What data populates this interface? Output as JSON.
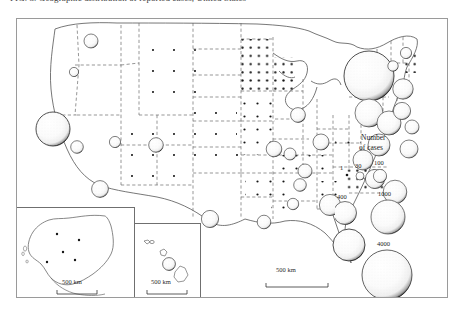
{
  "caption": {
    "text": "FIG. 3.  Geographic distribution of reported cases, United States",
    "suffix": "continued"
  },
  "map": {
    "title": "United States dot-density and proportional-symbol case map",
    "legend": {
      "title_line1": "Number",
      "title_line2": "of cases",
      "unit_dot_label": "1",
      "classes": [
        {
          "label": "30",
          "value": 30,
          "radius": 4.0
        },
        {
          "label": "100",
          "value": 100,
          "radius": 6.6
        },
        {
          "label": "400",
          "value": 400,
          "radius": 11.5
        },
        {
          "label": "1000",
          "value": 1000,
          "radius": 17.0
        },
        {
          "label": "4000",
          "value": 4000,
          "radius": 25.0
        }
      ]
    },
    "scale_bars": [
      {
        "name": "main-map-scale",
        "label": "500 km"
      },
      {
        "name": "alaska-scale",
        "label": "500 km"
      },
      {
        "name": "hawaii-scale",
        "label": "500 km"
      }
    ],
    "insets": [
      {
        "name": "alaska-inset",
        "label": "Alaska"
      },
      {
        "name": "hawaii-inset",
        "label": "Hawaii"
      }
    ]
  },
  "chart_data": {
    "type": "map",
    "symbol_encoding": "proportional-circle-area",
    "dot_encoding": "1 dot = 1 case",
    "legend_breaks": [
      1,
      30,
      100,
      400,
      1000,
      4000
    ],
    "symbols": [
      {
        "state": "WA",
        "value": 100,
        "x": 74,
        "y": 22,
        "r": 7.0
      },
      {
        "state": "OR",
        "value": 40,
        "x": 57,
        "y": 53,
        "r": 4.6
      },
      {
        "state": "CA",
        "value": 1000,
        "x": 36,
        "y": 110,
        "r": 17.0
      },
      {
        "state": "NV",
        "value": 90,
        "x": 60,
        "y": 128,
        "r": 6.3
      },
      {
        "state": "UT",
        "value": 70,
        "x": 98,
        "y": 123,
        "r": 5.6
      },
      {
        "state": "AZ",
        "value": 180,
        "x": 83,
        "y": 170,
        "r": 8.4
      },
      {
        "state": "CO",
        "value": 120,
        "x": 139,
        "y": 126,
        "r": 7.3
      },
      {
        "state": "TX",
        "value": 180,
        "x": 193,
        "y": 200,
        "r": 8.6
      },
      {
        "state": "IL",
        "value": 150,
        "x": 257,
        "y": 130,
        "r": 7.8
      },
      {
        "state": "MI",
        "value": 130,
        "x": 281,
        "y": 96,
        "r": 7.4
      },
      {
        "state": "OH",
        "value": 160,
        "x": 304,
        "y": 123,
        "r": 8.0
      },
      {
        "state": "IN",
        "value": 80,
        "x": 273,
        "y": 135,
        "r": 6.0
      },
      {
        "state": "KY",
        "value": 120,
        "x": 288,
        "y": 152,
        "r": 7.0
      },
      {
        "state": "TN",
        "value": 90,
        "x": 283,
        "y": 166,
        "r": 6.3
      },
      {
        "state": "GA",
        "value": 330,
        "x": 313,
        "y": 186,
        "r": 10.6
      },
      {
        "state": "AL",
        "value": 70,
        "x": 276,
        "y": 185,
        "r": 5.7
      },
      {
        "state": "LA",
        "value": 110,
        "x": 247,
        "y": 203,
        "r": 6.8
      },
      {
        "state": "FL",
        "value": 900,
        "x": 332,
        "y": 226,
        "r": 16.0
      },
      {
        "state": "NY",
        "value": 4000,
        "x": 352,
        "y": 57,
        "r": 25.0
      },
      {
        "state": "PA",
        "value": 700,
        "x": 352,
        "y": 94,
        "r": 14.0
      },
      {
        "state": "NJ",
        "value": 500,
        "x": 372,
        "y": 104,
        "r": 12.0
      },
      {
        "state": "MD",
        "value": 400,
        "x": 362,
        "y": 126,
        "r": 11.0
      },
      {
        "state": "VA",
        "value": 330,
        "x": 346,
        "y": 141,
        "r": 10.0
      },
      {
        "state": "NC",
        "value": 300,
        "x": 358,
        "y": 160,
        "r": 9.6
      },
      {
        "state": "SC",
        "value": 420,
        "x": 378,
        "y": 173,
        "r": 11.8
      },
      {
        "state": "MA",
        "value": 330,
        "x": 386,
        "y": 70,
        "r": 10.2
      },
      {
        "state": "CT",
        "value": 200,
        "x": 385,
        "y": 92,
        "r": 8.6
      },
      {
        "state": "RI",
        "value": 120,
        "x": 395,
        "y": 108,
        "r": 7.0
      },
      {
        "state": "NH",
        "value": 60,
        "x": 376,
        "y": 47,
        "r": 5.2
      },
      {
        "state": "ME",
        "value": 70,
        "x": 389,
        "y": 34,
        "r": 5.6
      },
      {
        "state": "DE",
        "value": 250,
        "x": 392,
        "y": 130,
        "r": 9.0
      },
      {
        "state": "HI",
        "value": 100,
        "x": 153,
        "y": 246,
        "r": 6.4
      }
    ],
    "dot_states": [
      "MN",
      "WI",
      "IA",
      "MO",
      "AR",
      "MS",
      "KS",
      "NE",
      "SD",
      "ND",
      "OK",
      "NM",
      "MT",
      "ID",
      "WY",
      "AK",
      "VT",
      "WV"
    ]
  }
}
